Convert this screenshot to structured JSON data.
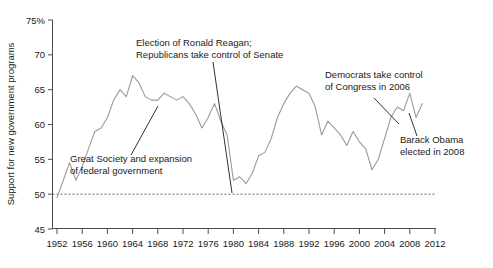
{
  "chart_data": {
    "type": "line",
    "title": "",
    "xlabel": "",
    "ylabel": "Support for new government programs",
    "xlim": [
      1952,
      2012
    ],
    "ylim": [
      45,
      75
    ],
    "grid": false,
    "legend_position": "none",
    "y_tick_labels": [
      "75%",
      "70",
      "65",
      "60",
      "55",
      "50",
      "45"
    ],
    "y_ticks": [
      75,
      70,
      65,
      60,
      55,
      50,
      45
    ],
    "x_tick_labels": [
      "1952",
      "1956",
      "1960",
      "1964",
      "1968",
      "1972",
      "1976",
      "1980",
      "1984",
      "1988",
      "1992",
      "1996",
      "2000",
      "2004",
      "2008",
      "2012"
    ],
    "x_ticks": [
      1952,
      1956,
      1960,
      1964,
      1968,
      1972,
      1976,
      1980,
      1984,
      1988,
      1992,
      1996,
      2000,
      2004,
      2008,
      2012
    ],
    "reference_line": {
      "value": 50,
      "style": "dotted",
      "label": ""
    },
    "series": [
      {
        "name": "Support for new government programs",
        "color": "#9a9a9a",
        "x": [
          1952,
          1953,
          1954,
          1955,
          1956,
          1957,
          1958,
          1959,
          1960,
          1961,
          1962,
          1963,
          1964,
          1965,
          1966,
          1967,
          1968,
          1969,
          1970,
          1971,
          1972,
          1973,
          1974,
          1975,
          1976,
          1977,
          1978,
          1979,
          1980,
          1981,
          1982,
          1983,
          1984,
          1985,
          1986,
          1987,
          1988,
          1989,
          1990,
          1991,
          1992,
          1993,
          1994,
          1995,
          1996,
          1997,
          1998,
          1999,
          2000,
          2001,
          2002,
          2003,
          2004,
          2005,
          2006,
          2007,
          2008,
          2009,
          2010
        ],
        "values": [
          49.5,
          52.0,
          54.5,
          52.0,
          54.0,
          56.5,
          59.0,
          59.5,
          61.0,
          63.5,
          65.0,
          64.0,
          67.0,
          66.0,
          64.0,
          63.5,
          63.5,
          64.5,
          64.0,
          63.5,
          64.0,
          63.0,
          61.5,
          59.5,
          61.0,
          63.0,
          60.5,
          58.5,
          52.0,
          52.5,
          51.5,
          53.0,
          55.5,
          56.0,
          58.0,
          61.0,
          63.0,
          64.5,
          65.5,
          65.0,
          64.5,
          62.5,
          58.5,
          60.5,
          59.5,
          58.5,
          57.0,
          59.0,
          57.5,
          56.5,
          53.5,
          55.0,
          58.0,
          61.0,
          62.5,
          62.0,
          64.5,
          61.0,
          63.0
        ]
      }
    ],
    "annotations": [
      {
        "id": "great-society",
        "lines": [
          "Great Society and expansion",
          "of federal government"
        ],
        "text_x": 70,
        "text_y": 162,
        "leader": {
          "x1": 131,
          "y1": 155,
          "x2": 158,
          "y2": 106
        }
      },
      {
        "id": "reagan",
        "lines": [
          "Election of Ronald Reagan;",
          "Republicans take control of Senate"
        ],
        "text_x": 136,
        "text_y": 46,
        "leader": {
          "x1": 213,
          "y1": 62,
          "x2": 232,
          "y2": 193
        }
      },
      {
        "id": "democrats-congress",
        "lines": [
          "Democrats take control",
          "of Congress in 2006"
        ],
        "text_x": 325,
        "text_y": 78,
        "leader": {
          "x1": 374,
          "y1": 98,
          "x2": 399,
          "y2": 124
        }
      },
      {
        "id": "obama",
        "lines": [
          "Barack Obama",
          "elected in 2008"
        ],
        "text_x": 400,
        "text_y": 143,
        "leader": {
          "x1": 417,
          "y1": 136,
          "x2": 409,
          "y2": 113
        }
      }
    ]
  },
  "axes": {
    "axis_color": "#4d4d4d",
    "line_color": "#9a9a9a",
    "text_color": "#1a1a1a"
  }
}
